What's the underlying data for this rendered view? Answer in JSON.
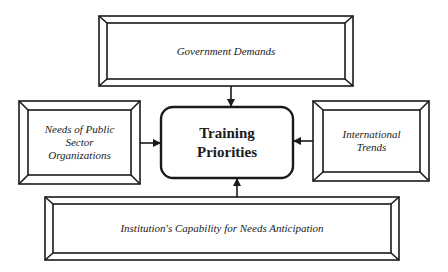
{
  "diagram": {
    "center": {
      "line1": "Training",
      "line2": "Priorities"
    },
    "top": {
      "label": "Government Demands"
    },
    "left": {
      "line1": "Needs of Public",
      "line2": "Sector",
      "line3": "Organizations"
    },
    "right": {
      "line1": "International",
      "line2": "Trends"
    },
    "bottom": {
      "label": "Institution's Capability for Needs Anticipation"
    }
  }
}
